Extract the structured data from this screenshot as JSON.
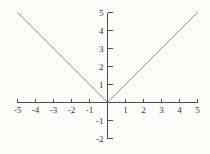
{
  "figure": {
    "background": "#fcfcfb"
  },
  "chart_data": {
    "type": "line",
    "title": "",
    "xlabel": "",
    "ylabel": "",
    "xlim": [
      -5,
      5
    ],
    "ylim": [
      -2,
      5
    ],
    "x_ticks": [
      -5,
      -4,
      -3,
      -2,
      -1,
      1,
      2,
      3,
      4,
      5
    ],
    "y_ticks": [
      -2,
      -1,
      1,
      2,
      3,
      4,
      5
    ],
    "grid": false,
    "legend": false,
    "series": [
      {
        "name": "y = |x|",
        "points": [
          [
            -5,
            5
          ],
          [
            0,
            0
          ],
          [
            5,
            5
          ]
        ],
        "color": "#8c8c8c"
      }
    ],
    "axis_color": "#4d4d4d",
    "tick_label_color": "#333333"
  }
}
